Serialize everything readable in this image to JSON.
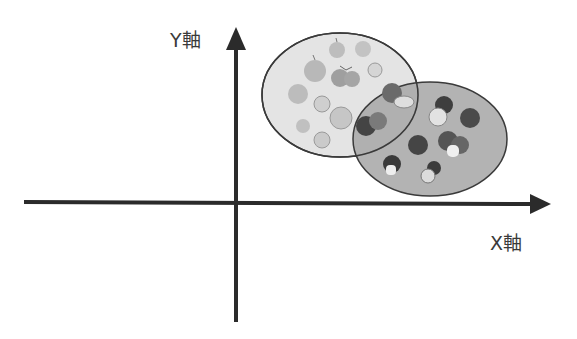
{
  "axes": {
    "x_label": "X軸",
    "y_label": "Y軸",
    "color": "#2b2b2b"
  },
  "clusters": [
    {
      "name": "orange-cluster",
      "fruit": "orange",
      "fill": "#e3e3e3",
      "stroke": "#3a3a3a",
      "item_count": 10
    },
    {
      "name": "apple-cluster",
      "fruit": "apple",
      "fill": "#a9a9a9",
      "stroke": "#3a3a3a",
      "item_count": 10
    }
  ],
  "icons": {
    "orange": "orange-fruit-icon",
    "apple": "apple-fruit-icon"
  }
}
